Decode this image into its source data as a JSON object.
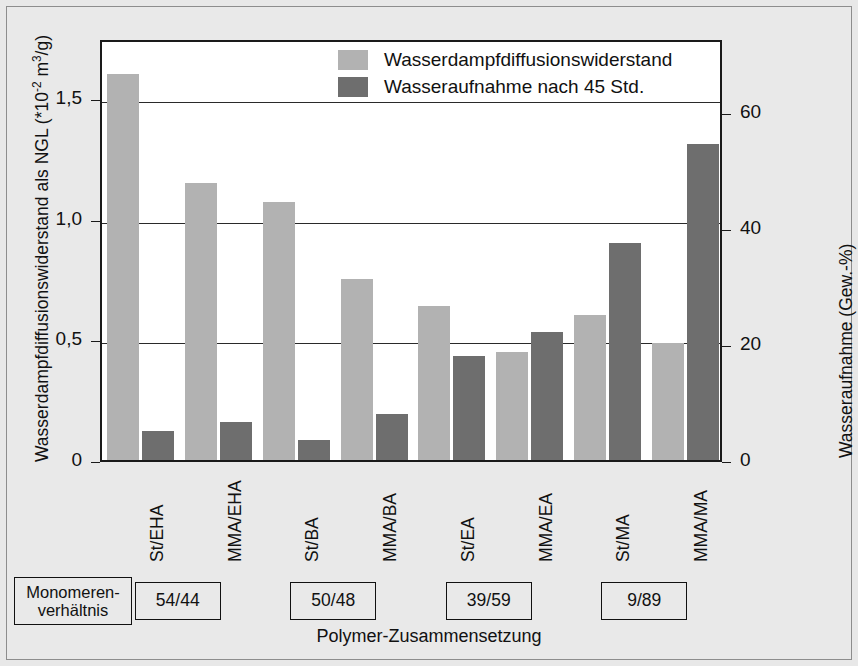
{
  "chart_data": {
    "type": "bar",
    "title": "",
    "categories": [
      "St/EHA",
      "MMA/EHA",
      "St/BA",
      "MMA/BA",
      "St/EA",
      "MMA/EA",
      "St/MA",
      "MMA/MA"
    ],
    "series": [
      {
        "name": "Wasserdampfdiffusionswiderstand",
        "axis": "left",
        "color": "#b2b2b2",
        "values": [
          1.6,
          1.15,
          1.07,
          0.75,
          0.64,
          0.45,
          0.6,
          0.485
        ]
      },
      {
        "name": "Wasseraufnahme nach 45 Std.",
        "axis": "right",
        "color": "#6e6e6e",
        "values": [
          5.0,
          6.5,
          3.5,
          8.0,
          18.0,
          22.0,
          37.5,
          54.5
        ]
      }
    ],
    "xlabel": "Polymer-Zusammensetzung",
    "ylabel_left": "Wasserdampfdiffusionswiderstand als NGL (*10",
    "ylabel_left_exponent": "-2",
    "ylabel_left_tail": " m",
    "ylabel_left_exponent2": "3",
    "ylabel_left_tail2": "/g)",
    "ylabel_right": "Wasseraufnahme (Gew.-%)",
    "ylim_left": [
      0,
      1.75
    ],
    "ylim_right": [
      0,
      72.8
    ],
    "yticks_left": [
      0,
      0.5,
      1.0,
      1.5
    ],
    "yticklabels_left": [
      "0",
      "0,5",
      "1,0",
      "1,5"
    ],
    "yticks_right": [
      0,
      20,
      40,
      60
    ],
    "yticklabels_right": [
      "0",
      "20",
      "40",
      "60"
    ],
    "grid": true,
    "legend_position": "top-center"
  },
  "legend": {
    "items": [
      {
        "label": "Wasserdampfdiffusionswiderstand",
        "swatch": "light"
      },
      {
        "label": "Wasseraufnahme nach 45 Std.",
        "swatch": "dark"
      }
    ]
  },
  "monomer": {
    "title_line1": "Monomeren-",
    "title_line2": "verhältnis",
    "boxes": [
      {
        "label": "54/44"
      },
      {
        "label": "50/48"
      },
      {
        "label": "39/59"
      },
      {
        "label": "9/89"
      }
    ]
  },
  "colors": {
    "light_bar": "#b2b2b2",
    "dark_bar": "#6e6e6e",
    "frame": "#1a1a1a",
    "background": "#e9e9e9",
    "plot_background": "#ffffff"
  }
}
